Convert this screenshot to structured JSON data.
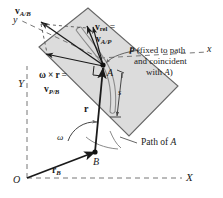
{
  "figure": {
    "type": "engineering-mechanics-vector-diagram",
    "colors": {
      "plate_fill": "#dcdcdc",
      "plate_stroke": "#555555",
      "line": "#1a1a1a",
      "axis_dash": "#777777",
      "background": "#ffffff"
    },
    "labels": {
      "v_a_over_b": {
        "vec": "v",
        "sub": "A/B"
      },
      "v_rel": {
        "vec": "v",
        "sub": "rel",
        "eq": "="
      },
      "v_a_over_p": {
        "vec": "v",
        "sub": "A/P"
      },
      "omega_cross_r": {
        "omega": "ω",
        "times": "×",
        "r": "r",
        "eq": "="
      },
      "v_p_over_b": {
        "vec": "v",
        "sub": "P/B"
      },
      "r_vector": "r",
      "r_b_vector": {
        "vec": "r",
        "sub": "B"
      },
      "omega_angle": "ω",
      "s_dimension": "s",
      "point_a": "A",
      "point_b": "B",
      "point_p": "P",
      "origin": "O",
      "path_of_a": "Path of A",
      "p_note_line1": "P (fixed to path",
      "p_note_line2": "and coincident",
      "p_note_line3": "with A)",
      "axis_x_rotating": "x",
      "axis_y_rotating": "y",
      "axis_X_fixed": "X",
      "axis_Y_fixed": "Y"
    }
  }
}
